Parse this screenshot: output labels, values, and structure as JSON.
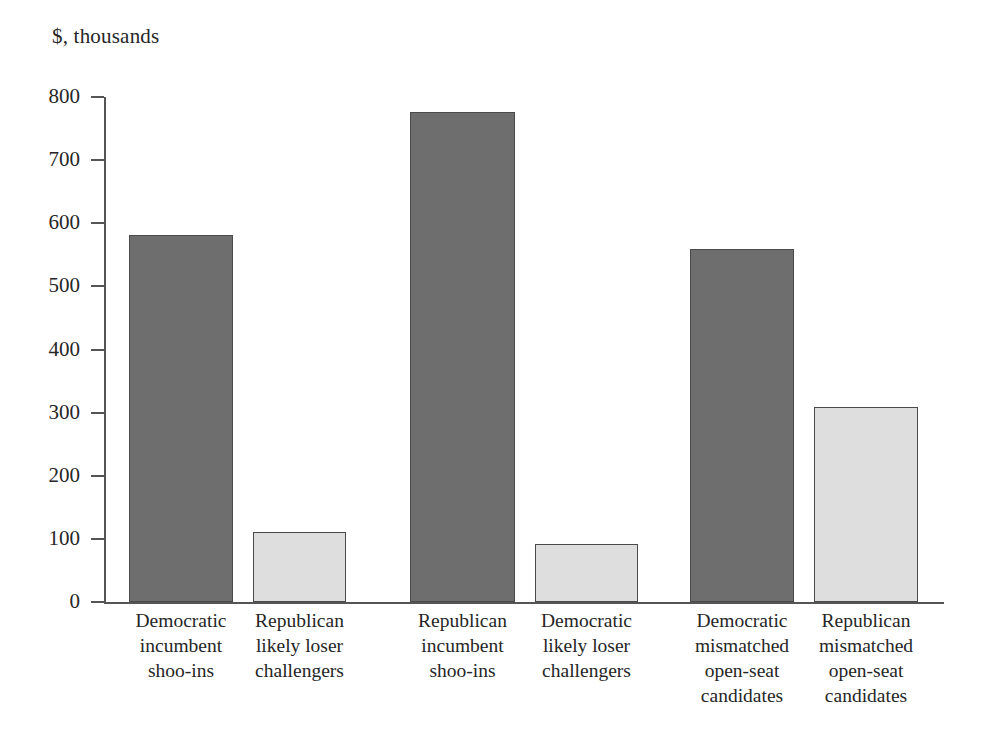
{
  "chart_data": {
    "type": "bar",
    "title": "$, thousands",
    "xlabel": "",
    "ylabel": "",
    "ylim": [
      0,
      800
    ],
    "ytick_step": 100,
    "grid": false,
    "legend": "none",
    "categories": [
      "Democratic incumbent shoo-ins",
      "Republican likely loser challengers",
      "Republican incumbent shoo-ins",
      "Democratic likely loser challengers",
      "Democratic mismatched open-seat candidates",
      "Republican mismatched open-seat candidates"
    ],
    "category_lines": [
      [
        "Democratic",
        "incumbent",
        "shoo-ins"
      ],
      [
        "Republican",
        "likely loser",
        "challengers"
      ],
      [
        "Republican",
        "incumbent",
        "shoo-ins"
      ],
      [
        "Democratic",
        "likely loser",
        "challengers"
      ],
      [
        "Democratic",
        "mismatched",
        "open-seat",
        "candidates"
      ],
      [
        "Republican",
        "mismatched",
        "open-seat",
        "candidates"
      ]
    ],
    "values": [
      582,
      111,
      776,
      92,
      560,
      309
    ],
    "ytick_labels": [
      "800",
      "700",
      "600",
      "500",
      "400",
      "300",
      "200",
      "100",
      "0"
    ],
    "ytick_values": [
      800,
      700,
      600,
      500,
      400,
      300,
      200,
      100,
      0
    ],
    "bar_colors": [
      "#6e6e6e",
      "#dedede",
      "#6e6e6e",
      "#dedede",
      "#6e6e6e",
      "#dedede"
    ],
    "bar_border_color": "#4a4a4a",
    "axis_color": "#555555",
    "text_color": "#262626",
    "background_color": "#ffffff"
  },
  "geometry": {
    "bar_left_px": [
      25,
      149,
      306,
      431,
      586,
      710
    ],
    "bar_width_px": [
      104,
      93,
      105,
      103,
      104,
      104
    ]
  }
}
